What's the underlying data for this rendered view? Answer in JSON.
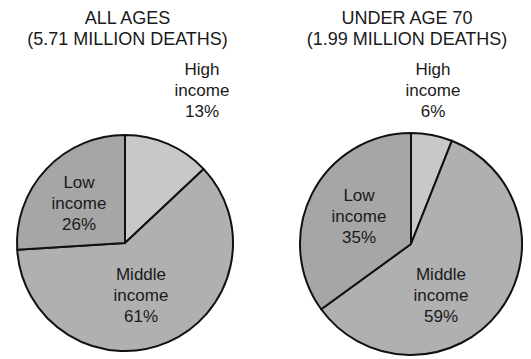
{
  "chart_data": [
    {
      "type": "pie",
      "title": "ALL AGES",
      "subtitle": "(5.71 MILLION DEATHS)",
      "categories": [
        "High income",
        "Middle income",
        "Low income"
      ],
      "values": [
        13,
        61,
        26
      ],
      "unit": "%",
      "labels": [
        {
          "line1": "High",
          "line2": "income",
          "line3": "13%"
        },
        {
          "line1": "Middle",
          "line2": "income",
          "line3": "61%"
        },
        {
          "line1": "Low",
          "line2": "income",
          "line3": "26%"
        }
      ],
      "colors": [
        "#c8c8c8",
        "#b0b0b0",
        "#a6a6a6"
      ],
      "start_angle_deg": 0,
      "direction": "clockwise",
      "legend": "none"
    },
    {
      "type": "pie",
      "title": "UNDER AGE 70",
      "subtitle": "(1.99 MILLION DEATHS)",
      "categories": [
        "High income",
        "Middle income",
        "Low income"
      ],
      "values": [
        6,
        59,
        35
      ],
      "unit": "%",
      "labels": [
        {
          "line1": "High",
          "line2": "income",
          "line3": "6%"
        },
        {
          "line1": "Middle",
          "line2": "income",
          "line3": "59%"
        },
        {
          "line1": "Low",
          "line2": "income",
          "line3": "35%"
        }
      ],
      "colors": [
        "#c8c8c8",
        "#b0b0b0",
        "#a6a6a6"
      ],
      "start_angle_deg": 0,
      "direction": "clockwise",
      "legend": "none"
    }
  ]
}
